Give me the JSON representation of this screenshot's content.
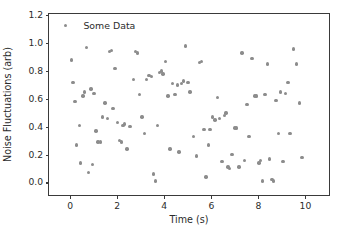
{
  "chart_data": {
    "type": "scatter",
    "title": "",
    "xlabel": "Time (s)",
    "ylabel": "Noise Fluctuations (arb)",
    "xlim": [
      -0.9,
      11.0
    ],
    "ylim": [
      -0.09,
      1.21
    ],
    "xticks": [
      0,
      2,
      4,
      6,
      8,
      10
    ],
    "xticklabels": [
      "0",
      "2",
      "4",
      "6",
      "8",
      "10"
    ],
    "yticks": [
      0.0,
      0.2,
      0.4,
      0.6,
      0.8,
      1.0,
      1.2
    ],
    "yticklabels": [
      "0.0",
      "0.2",
      "0.4",
      "0.6",
      "0.8",
      "1.0",
      "1.2"
    ],
    "grid": false,
    "legend_position": "upper left",
    "marker_color": "#8c8c8c",
    "axes_color": "#3a3a3a",
    "background_color": "#ffffff",
    "series": [
      {
        "name": "Some Data",
        "marker": "o",
        "color": "#8c8c8c",
        "points": [
          [
            0.05,
            0.88
          ],
          [
            0.12,
            0.72
          ],
          [
            0.2,
            0.58
          ],
          [
            0.28,
            0.27
          ],
          [
            0.4,
            0.41
          ],
          [
            0.45,
            0.14
          ],
          [
            0.55,
            0.62
          ],
          [
            0.62,
            0.65
          ],
          [
            0.7,
            0.97
          ],
          [
            0.78,
            0.07
          ],
          [
            0.88,
            0.67
          ],
          [
            0.95,
            0.13
          ],
          [
            1.02,
            0.64
          ],
          [
            1.1,
            0.37
          ],
          [
            1.18,
            0.29
          ],
          [
            1.28,
            0.29
          ],
          [
            1.38,
            0.47
          ],
          [
            1.48,
            0.57
          ],
          [
            1.58,
            0.46
          ],
          [
            1.68,
            0.94
          ],
          [
            1.75,
            0.95
          ],
          [
            1.82,
            0.53
          ],
          [
            1.9,
            0.82
          ],
          [
            2.0,
            0.43
          ],
          [
            2.1,
            0.3
          ],
          [
            2.18,
            0.29
          ],
          [
            2.25,
            0.41
          ],
          [
            2.32,
            0.42
          ],
          [
            2.42,
            0.24
          ],
          [
            2.55,
            0.4
          ],
          [
            2.68,
            0.74
          ],
          [
            2.78,
            0.94
          ],
          [
            2.85,
            0.93
          ],
          [
            2.95,
            0.63
          ],
          [
            3.05,
            0.47
          ],
          [
            3.15,
            0.35
          ],
          [
            3.25,
            0.74
          ],
          [
            3.35,
            0.77
          ],
          [
            3.45,
            0.76
          ],
          [
            3.55,
            0.06
          ],
          [
            3.62,
            0.01
          ],
          [
            3.7,
            0.41
          ],
          [
            3.8,
            0.79
          ],
          [
            3.88,
            0.8
          ],
          [
            3.95,
            0.78
          ],
          [
            4.05,
            0.87
          ],
          [
            4.15,
            0.62
          ],
          [
            4.25,
            0.24
          ],
          [
            4.35,
            0.71
          ],
          [
            4.45,
            0.63
          ],
          [
            4.55,
            0.7
          ],
          [
            4.62,
            0.22
          ],
          [
            4.72,
            0.71
          ],
          [
            4.82,
            0.73
          ],
          [
            4.9,
            0.98
          ],
          [
            5.0,
            0.72
          ],
          [
            5.1,
            0.65
          ],
          [
            5.25,
            0.33
          ],
          [
            5.38,
            0.19
          ],
          [
            5.5,
            0.86
          ],
          [
            5.58,
            0.87
          ],
          [
            5.68,
            0.38
          ],
          [
            5.78,
            0.04
          ],
          [
            5.88,
            0.27
          ],
          [
            5.95,
            0.38
          ],
          [
            6.05,
            0.47
          ],
          [
            6.15,
            0.45
          ],
          [
            6.25,
            0.61
          ],
          [
            6.35,
            0.46
          ],
          [
            6.45,
            0.15
          ],
          [
            6.55,
            0.48
          ],
          [
            6.62,
            0.5
          ],
          [
            6.7,
            0.11
          ],
          [
            6.78,
            0.1
          ],
          [
            6.88,
            0.2
          ],
          [
            7.0,
            0.39
          ],
          [
            7.08,
            0.39
          ],
          [
            7.18,
            0.11
          ],
          [
            7.3,
            0.93
          ],
          [
            7.42,
            0.16
          ],
          [
            7.52,
            0.56
          ],
          [
            7.6,
            0.33
          ],
          [
            7.72,
            0.89
          ],
          [
            7.85,
            0.62
          ],
          [
            7.92,
            0.62
          ],
          [
            8.02,
            0.14
          ],
          [
            8.1,
            0.16
          ],
          [
            8.18,
            0.01
          ],
          [
            8.28,
            0.63
          ],
          [
            8.38,
            0.85
          ],
          [
            8.48,
            0.17
          ],
          [
            8.58,
            0.02
          ],
          [
            8.65,
            0.01
          ],
          [
            8.75,
            0.59
          ],
          [
            8.85,
            0.35
          ],
          [
            8.95,
            0.65
          ],
          [
            9.05,
            0.15
          ],
          [
            9.15,
            0.64
          ],
          [
            9.25,
            0.72
          ],
          [
            9.35,
            0.35
          ],
          [
            9.5,
            0.96
          ],
          [
            9.62,
            0.85
          ],
          [
            9.75,
            0.57
          ],
          [
            9.85,
            0.18
          ]
        ]
      }
    ]
  },
  "legend": {
    "label": "Some Data"
  }
}
